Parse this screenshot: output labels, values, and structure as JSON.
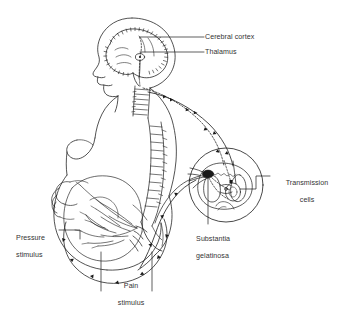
{
  "figure": {
    "style": "black and white line drawing",
    "background_color": "#ffffff",
    "line_color": "#1a1a1a",
    "text_color": "#333333"
  },
  "labels": {
    "cerebral_cortex": "Cerebral cortex",
    "thalamus": "Thalamus",
    "transmission_cells_line1": "Transmission",
    "transmission_cells_line2": "cells",
    "substantia_line1": "Substantia",
    "substantia_line2": "gelatinosa",
    "pressure_line1": "Pressure",
    "pressure_line2": "stimulus",
    "pain_line1": "Pain",
    "pain_line2": "stimulus"
  },
  "anatomy": {
    "subject": "pregnant woman in left-facing profile",
    "parts": [
      "head and face profile",
      "brain with cerebral cortex convolutions",
      "thalamus",
      "cervical vertebrae",
      "lumbar vertebrae and sacrum",
      "breast and torso outline",
      "gravid abdomen with hand resting on it",
      "uterus and fetus outline",
      "spinal cord cross-section inset"
    ],
    "inset": {
      "name": "spinal cord cross-section",
      "features": [
        "butterfly shaped grey matter",
        "substantia gelatinosa (dark shaded region)",
        "transmission cells (oval)",
        "dorsal root nerve fibres"
      ]
    },
    "pathways": [
      {
        "name": "ascending pain pathway",
        "style": "dashed with arrowheads"
      },
      {
        "name": "ascending pressure pathway",
        "style": "solid with arrowheads"
      },
      {
        "name": "peripheral nerve branches in abdomen",
        "style": "solid branching"
      }
    ]
  }
}
